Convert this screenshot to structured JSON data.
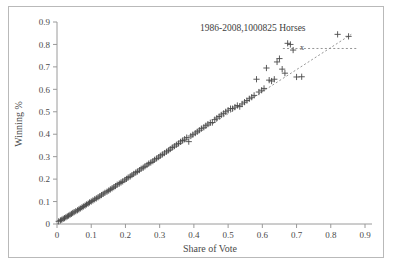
{
  "figure": {
    "border_color": "#b9b9b9",
    "background": "#ffffff"
  },
  "chart_data": {
    "type": "scatter",
    "title": "",
    "annotation": "1986-2008,1000825 Horses",
    "point_label": "x",
    "xlabel": "Share of Vote",
    "ylabel": "Winning %",
    "xlim": [
      0,
      0.9
    ],
    "ylim": [
      0,
      0.9
    ],
    "xticks": [
      0,
      0.1,
      0.2,
      0.3,
      0.4,
      0.5,
      0.6,
      0.7,
      0.8,
      0.9
    ],
    "xtick_labels": [
      "0",
      "0.1",
      "0.2",
      "0.3",
      "0.4",
      "0.5",
      "0.6",
      "0.7",
      "0.8",
      "0.9"
    ],
    "yticks": [
      0,
      0.1,
      0.2,
      0.3,
      0.4,
      0.5,
      0.6,
      0.7,
      0.8,
      0.9
    ],
    "ytick_labels": [
      "0",
      "0.1",
      "0.2",
      "0.3",
      "0.4",
      "0.5",
      "0.6",
      "0.7",
      "0.8",
      "0.9"
    ],
    "grid": false,
    "legend": "none",
    "marker": "plus",
    "marker_color": "#4a4a4a",
    "trendline": {
      "style": "dashed",
      "color": "#8a8a8a",
      "x": [
        0.0,
        0.86
      ],
      "y": [
        0.0,
        0.845
      ]
    },
    "leader_line": {
      "style": "dashed",
      "color": "#8a8a8a",
      "x": [
        0.66,
        0.88
      ],
      "y": [
        0.782,
        0.782
      ]
    },
    "x": [
      0.005,
      0.01,
      0.014,
      0.018,
      0.022,
      0.026,
      0.03,
      0.034,
      0.038,
      0.042,
      0.046,
      0.05,
      0.055,
      0.06,
      0.064,
      0.068,
      0.073,
      0.077,
      0.082,
      0.086,
      0.091,
      0.095,
      0.1,
      0.105,
      0.11,
      0.115,
      0.12,
      0.125,
      0.13,
      0.135,
      0.14,
      0.146,
      0.151,
      0.156,
      0.161,
      0.166,
      0.171,
      0.176,
      0.182,
      0.187,
      0.192,
      0.198,
      0.203,
      0.208,
      0.214,
      0.219,
      0.224,
      0.23,
      0.235,
      0.241,
      0.246,
      0.252,
      0.257,
      0.263,
      0.268,
      0.274,
      0.28,
      0.285,
      0.291,
      0.297,
      0.302,
      0.308,
      0.314,
      0.32,
      0.326,
      0.331,
      0.337,
      0.343,
      0.349,
      0.355,
      0.361,
      0.367,
      0.373,
      0.379,
      0.385,
      0.391,
      0.397,
      0.404,
      0.41,
      0.416,
      0.422,
      0.429,
      0.435,
      0.441,
      0.448,
      0.454,
      0.461,
      0.467,
      0.474,
      0.48,
      0.487,
      0.493,
      0.5,
      0.507,
      0.513,
      0.52,
      0.527,
      0.534,
      0.541,
      0.548,
      0.555,
      0.562,
      0.569,
      0.576,
      0.583,
      0.59,
      0.598,
      0.605,
      0.612,
      0.62,
      0.627,
      0.635,
      0.643,
      0.65,
      0.658,
      0.666,
      0.674,
      0.682,
      0.69,
      0.7,
      0.715,
      0.82,
      0.852
    ],
    "y": [
      0.012,
      0.016,
      0.019,
      0.023,
      0.026,
      0.03,
      0.034,
      0.037,
      0.041,
      0.045,
      0.049,
      0.053,
      0.057,
      0.061,
      0.065,
      0.069,
      0.074,
      0.078,
      0.082,
      0.087,
      0.091,
      0.096,
      0.1,
      0.105,
      0.11,
      0.114,
      0.119,
      0.124,
      0.129,
      0.134,
      0.139,
      0.144,
      0.149,
      0.154,
      0.159,
      0.164,
      0.169,
      0.175,
      0.18,
      0.185,
      0.19,
      0.196,
      0.201,
      0.207,
      0.212,
      0.218,
      0.223,
      0.229,
      0.234,
      0.24,
      0.246,
      0.251,
      0.257,
      0.263,
      0.269,
      0.274,
      0.28,
      0.286,
      0.292,
      0.298,
      0.304,
      0.31,
      0.316,
      0.322,
      0.328,
      0.334,
      0.341,
      0.347,
      0.353,
      0.359,
      0.366,
      0.372,
      0.378,
      0.385,
      0.367,
      0.392,
      0.398,
      0.405,
      0.411,
      0.418,
      0.425,
      0.431,
      0.438,
      0.445,
      0.451,
      0.452,
      0.465,
      0.472,
      0.479,
      0.486,
      0.493,
      0.5,
      0.507,
      0.514,
      0.514,
      0.521,
      0.528,
      0.523,
      0.535,
      0.543,
      0.55,
      0.558,
      0.565,
      0.573,
      0.645,
      0.588,
      0.596,
      0.604,
      0.695,
      0.641,
      0.637,
      0.645,
      0.722,
      0.737,
      0.69,
      0.672,
      0.805,
      0.8,
      0.775,
      0.655,
      0.656,
      0.845,
      0.836
    ]
  }
}
